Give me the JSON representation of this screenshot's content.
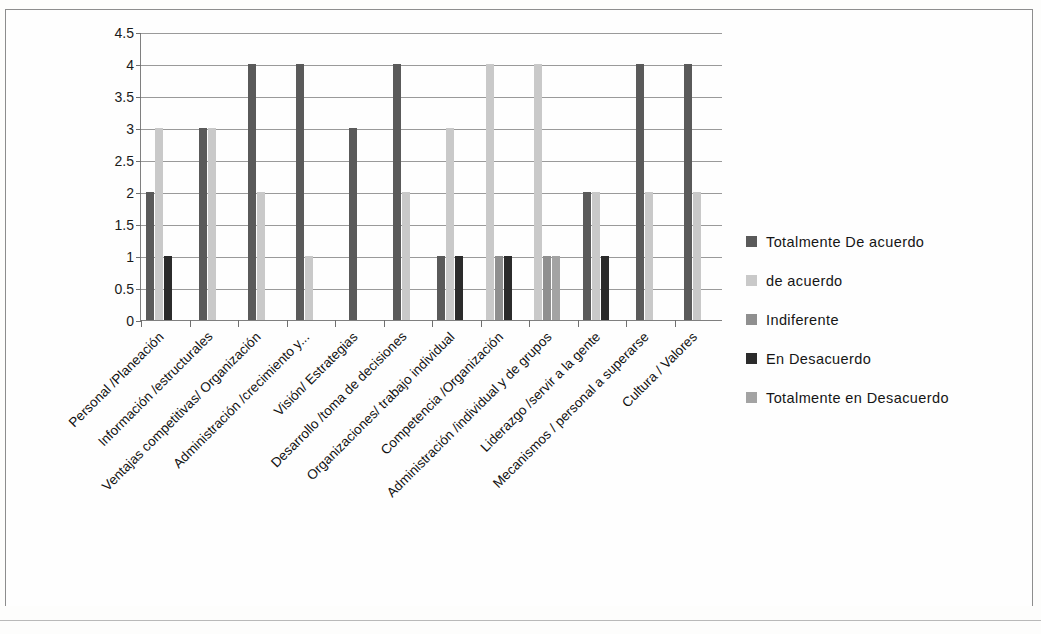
{
  "chart_data": {
    "type": "bar",
    "title": "",
    "subtitle": "",
    "xlabel": "",
    "ylabel": "",
    "ylim": [
      0,
      4.5
    ],
    "ytick_labels": [
      "4.5",
      "4",
      "3.5",
      "3",
      "2.5",
      "2",
      "1.5",
      "1",
      "0.5",
      "0"
    ],
    "ytick_values": [
      4.5,
      4,
      3.5,
      3,
      2.5,
      2,
      1.5,
      1,
      0.5,
      0
    ],
    "grid": true,
    "legend_position": "right",
    "categories": [
      "Personal /Planeación",
      "Información /estructurales",
      "Ventajas competitivas/ Organización",
      "Administración /crecimiento y...",
      "Visión/ Estrategias",
      "Desarrollo /toma de decisiones",
      "Organizaciones/ trabajo individual",
      "Competencia /Organización",
      "Administración /individual y de grupos",
      "Liderazgo /servir a la gente",
      "Mecanismos / personal a superarse",
      "Cultura / Valores"
    ],
    "series": [
      {
        "name": "Totalmente De acuerdo",
        "color": "#5a5a5a",
        "values": [
          2,
          3,
          4,
          4,
          3,
          4,
          1,
          0,
          0,
          2,
          4,
          4
        ]
      },
      {
        "name": " de acuerdo",
        "color": "#c9c9c9",
        "values": [
          3,
          3,
          2,
          1,
          0,
          2,
          3,
          4,
          4,
          2,
          2,
          2
        ]
      },
      {
        "name": "Indiferente",
        "color": "#8f8f8f",
        "values": [
          0,
          0,
          0,
          0,
          0,
          0,
          0,
          1,
          1,
          0,
          0,
          0
        ]
      },
      {
        "name": "En Desacuerdo",
        "color": "#2b2b2b",
        "values": [
          1,
          0,
          0,
          0,
          0,
          0,
          1,
          1,
          0,
          1,
          0,
          0
        ]
      },
      {
        "name": "Totalmente en Desacuerdo",
        "color": "#a3a3a3",
        "values": [
          0,
          0,
          0,
          0,
          0,
          0,
          0,
          0,
          1,
          0,
          0,
          0
        ]
      }
    ]
  },
  "legend": {
    "items": [
      {
        "label": "Totalmente De acuerdo",
        "color": "#5a5a5a"
      },
      {
        "label": " de acuerdo",
        "color": "#c9c9c9"
      },
      {
        "label": "Indiferente",
        "color": "#8f8f8f"
      },
      {
        "label": "En Desacuerdo",
        "color": "#2b2b2b"
      },
      {
        "label": "Totalmente en Desacuerdo",
        "color": "#a3a3a3"
      }
    ]
  }
}
